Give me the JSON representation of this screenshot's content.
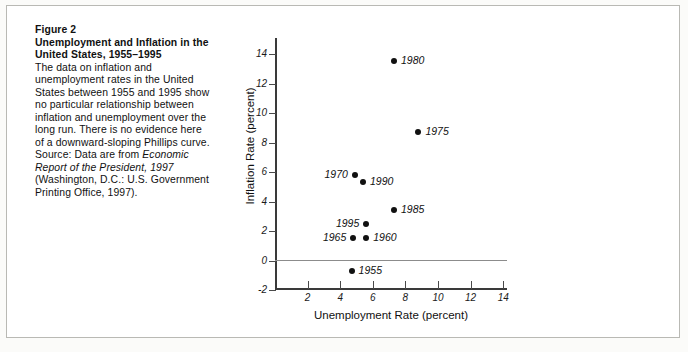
{
  "figure": {
    "number": "Figure 2",
    "title": "Unemployment and Inflation in the United States, 1955–1995",
    "body_before_source": "The data on inflation and unemployment rates in the United States between 1955 and 1995 show no particular relationship between inflation and unemployment over the long run. There is no evidence here of a downward-sloping Phillips curve.",
    "source_prefix": "Source: Data are from ",
    "source_italic": "Economic Report of the President, 1997",
    "source_suffix": " (Washington, D.C.: U.S. Government Printing Office, 1997)."
  },
  "chart_data": {
    "type": "scatter",
    "title": "",
    "xlabel": "Unemployment Rate (percent)",
    "ylabel": "Inflation Rate (percent)",
    "xlim": [
      0,
      15
    ],
    "ylim": [
      -2,
      14
    ],
    "xticks": [
      2,
      4,
      6,
      8,
      10,
      12,
      14
    ],
    "yticks": [
      -2,
      0,
      2,
      4,
      6,
      8,
      10,
      12,
      14
    ],
    "grid": false,
    "legend": "none",
    "zero_line": 0,
    "points": [
      {
        "label": "1955",
        "x": 4.7,
        "y": -0.7,
        "label_pos": "right"
      },
      {
        "label": "1960",
        "x": 5.6,
        "y": 1.5,
        "label_pos": "right"
      },
      {
        "label": "1965",
        "x": 4.8,
        "y": 1.5,
        "label_pos": "left"
      },
      {
        "label": "1970",
        "x": 4.9,
        "y": 5.8,
        "label_pos": "left"
      },
      {
        "label": "1975",
        "x": 8.8,
        "y": 8.7,
        "label_pos": "right"
      },
      {
        "label": "1980",
        "x": 7.3,
        "y": 13.5,
        "label_pos": "right"
      },
      {
        "label": "1985",
        "x": 7.3,
        "y": 3.4,
        "label_pos": "right"
      },
      {
        "label": "1990",
        "x": 5.4,
        "y": 5.3,
        "label_pos": "right"
      },
      {
        "label": "1995",
        "x": 5.6,
        "y": 2.5,
        "label_pos": "left"
      }
    ]
  },
  "colors": {
    "ink": "#111111",
    "axis": "#3a3a3a",
    "zero_line": "#8c8c8c",
    "page": "#ffffff",
    "frame": "#b9b9b4"
  }
}
